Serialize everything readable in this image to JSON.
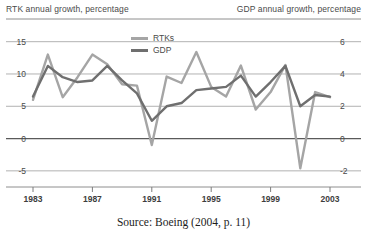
{
  "chart_data": {
    "type": "line",
    "title": "",
    "subtitle": "",
    "xlabel": "",
    "ylabel": "RTK annual growth, percentage",
    "ylabel_right": "GDP annual growth, percentage",
    "grid": true,
    "legend_position": "top-center",
    "x": [
      1983,
      1984,
      1985,
      1986,
      1987,
      1988,
      1989,
      1990,
      1991,
      1992,
      1993,
      1994,
      1995,
      1996,
      1997,
      1998,
      1999,
      2000,
      2001,
      2002,
      2003
    ],
    "xlim": [
      1983,
      2003
    ],
    "xticks": [
      "1983",
      "1987",
      "1991",
      "1995",
      "1999",
      "2003"
    ],
    "xtick_values": [
      1983,
      1987,
      1991,
      1995,
      1999,
      2003
    ],
    "ylim": [
      -7.5,
      16.5
    ],
    "yticks": [
      "15",
      "10",
      "5",
      "0",
      "-5"
    ],
    "ytick_values": [
      15,
      10,
      5,
      0,
      -5
    ],
    "ylim_right": [
      -3,
      6.6
    ],
    "yticks_right": [
      "6",
      "4",
      "2",
      "0",
      "-2"
    ],
    "ytick_values_right": [
      6,
      4,
      2,
      0,
      -2
    ],
    "series": [
      {
        "name": "RTKs",
        "axis": "left",
        "color": "#a5a5a5",
        "values": [
          6.0,
          13.0,
          6.4,
          9.5,
          13.0,
          11.5,
          8.4,
          8.2,
          -1.0,
          9.6,
          8.6,
          13.4,
          8.0,
          6.5,
          11.3,
          4.5,
          7.2,
          11.4,
          -4.6,
          7.2,
          6.4
        ]
      },
      {
        "name": "GDP",
        "axis": "right",
        "color": "#6f6f6f",
        "values": [
          2.6,
          4.5,
          3.8,
          3.5,
          3.6,
          4.5,
          3.6,
          2.8,
          1.1,
          2.0,
          2.2,
          3.0,
          3.1,
          3.2,
          3.9,
          2.6,
          3.5,
          4.5,
          2.0,
          2.7,
          2.6
        ]
      }
    ],
    "legend": [
      {
        "label": "RTKs",
        "color": "#a5a5a5"
      },
      {
        "label": "GDP",
        "color": "#6f6f6f"
      }
    ]
  },
  "caption": {
    "source": "Source: Boeing (2004, p. 11)"
  }
}
